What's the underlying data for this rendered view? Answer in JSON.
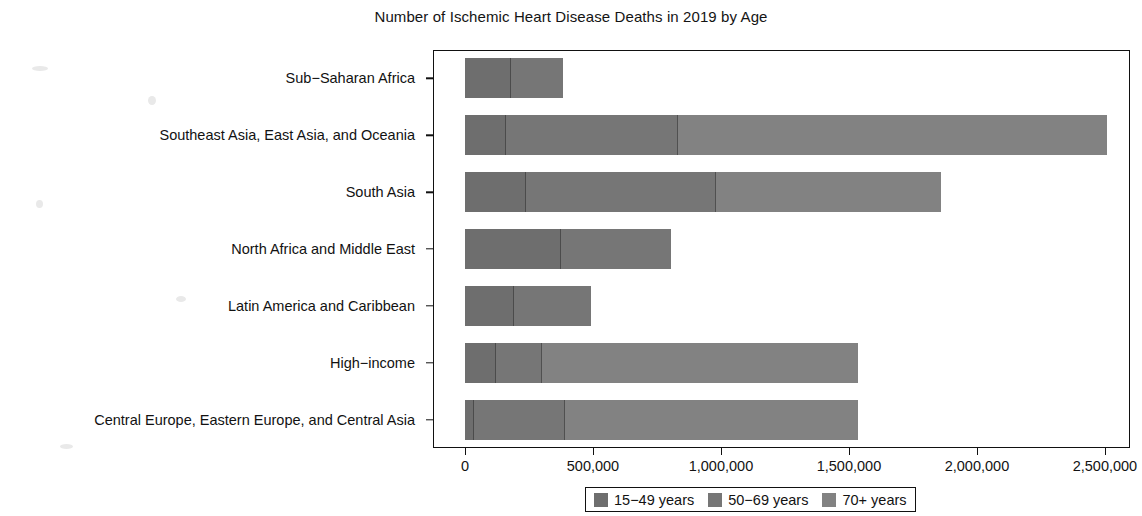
{
  "chart_data": {
    "type": "bar",
    "orientation": "horizontal",
    "stacked": true,
    "title": "Number of Ischemic Heart Disease Deaths in 2019 by Age",
    "xlabel": "",
    "ylabel": "",
    "xlim": [
      0,
      2600000
    ],
    "grid": false,
    "legend_position": "bottom",
    "xticks": [
      0,
      500000,
      1000000,
      1500000,
      2000000,
      2500000
    ],
    "xtick_labels": [
      "0",
      "500,000",
      "1,000,000",
      "1,500,000",
      "2,000,000",
      "2,500,000"
    ],
    "categories": [
      "Sub−Saharan Africa",
      "Southeast Asia, East Asia, and Oceania",
      "South Asia",
      "North Africa and Middle East",
      "Latin America and Caribbean",
      "High−income",
      "Central Europe, Eastern Europe, and Central Asia"
    ],
    "series": [
      {
        "name": "15−49 years",
        "color": "#6e6e6e",
        "values": [
          176000,
          156000,
          234000,
          371000,
          188000,
          117000,
          31000
        ]
      },
      {
        "name": "50−69 years",
        "color": "#767676",
        "values": [
          207000,
          672000,
          742000,
          434000,
          305000,
          180000,
          356000
        ]
      },
      {
        "name": "70+ years",
        "color": "#828282",
        "values": [
          0,
          1680000,
          883000,
          0,
          0,
          1239000,
          1150000
        ]
      }
    ],
    "totals": [
      383000,
      2508000,
      1859000,
      805000,
      493000,
      1536000,
      1537000
    ],
    "series_totals_note": ""
  },
  "legend": {
    "items": [
      {
        "label": "15−49 years",
        "color": "#6e6e6e"
      },
      {
        "label": "50−69 years",
        "color": "#767676"
      },
      {
        "label": "70+ years",
        "color": "#828282"
      }
    ]
  }
}
